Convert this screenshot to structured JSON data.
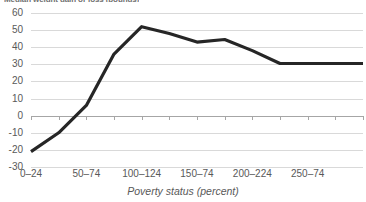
{
  "chart_data": {
    "type": "line",
    "title": "Median weight gain or loss (pounds)",
    "xlabel": "Poverty status (percent)",
    "ylabel": "",
    "ylim": [
      -30,
      60
    ],
    "ytick_labels": [
      "60",
      "50",
      "40",
      "30",
      "20",
      "10",
      "0",
      "-10",
      "-20",
      "-30"
    ],
    "ytick_values": [
      60,
      50,
      40,
      30,
      20,
      10,
      0,
      -10,
      -20,
      -30
    ],
    "grid": true,
    "legend": "none",
    "categories": [
      "0–24",
      "25–49",
      "50–74",
      "75–99",
      "100–124",
      "125–149",
      "150–74",
      "175–199",
      "200–224",
      "225–249",
      "250–74",
      "275–299",
      "300+"
    ],
    "xtick_labels_shown": [
      "0–24",
      "50–74",
      "100–124",
      "150–74",
      "200–224",
      "250–74"
    ],
    "series": [
      {
        "name": "Median weight gain or loss",
        "color": "#262626",
        "values": [
          -21,
          -10,
          6,
          36,
          52,
          48,
          43,
          44.5,
          38,
          30.5,
          30.5,
          30.5,
          30.5
        ]
      }
    ]
  },
  "axis": {
    "x_title": "Poverty status (percent)"
  },
  "colors": {
    "series_line": "#262626",
    "gridline": "#d9d9d9",
    "axis_line": "#a6a6a6",
    "tick_text": "#595959",
    "title_text": "#6f6f6f",
    "background": "#ffffff"
  }
}
